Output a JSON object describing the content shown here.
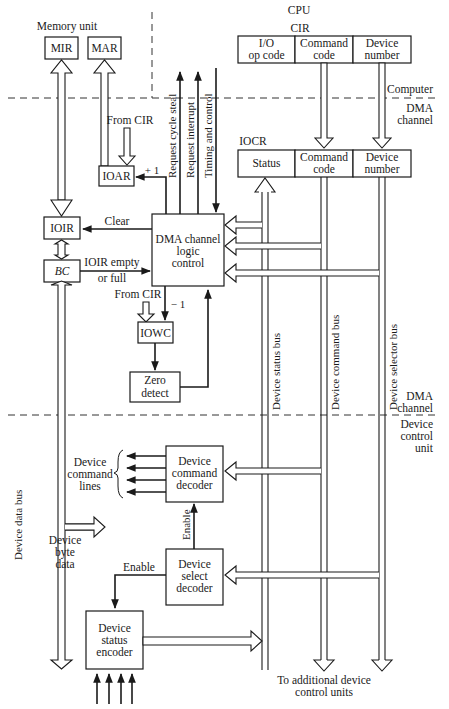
{
  "diagram": {
    "regions": {
      "cpu": "CPU",
      "memory_unit": "Memory unit",
      "computer": "Computer",
      "dma_channel_top": "DMA",
      "dma_channel_bottom": "channel",
      "dma_channel2_top": "DMA",
      "dma_channel2_bottom": "channel",
      "device_control_1": "Device",
      "device_control_2": "control",
      "device_control_3": "unit"
    },
    "registers": {
      "mir": "MIR",
      "mar": "MAR",
      "cir_title": "CIR",
      "cir_fields": [
        {
          "line1": "I/O",
          "line2": "op code"
        },
        {
          "line1": "Command",
          "line2": "code"
        },
        {
          "line1": "Device",
          "line2": "number"
        }
      ],
      "iocr_title": "IOCR",
      "iocr_fields": [
        {
          "line1": "Status"
        },
        {
          "line1": "Command",
          "line2": "code"
        },
        {
          "line1": "Device",
          "line2": "number"
        }
      ],
      "ioar": "IOAR",
      "ioir": "IOIR",
      "bc": "BC",
      "iowc": "IOWC"
    },
    "blocks": {
      "dma_logic": {
        "line1": "DMA channel",
        "line2": "logic",
        "line3": "control"
      },
      "zero_detect": {
        "line1": "Zero",
        "line2": "detect"
      },
      "cmd_decoder": {
        "line1": "Device",
        "line2": "command",
        "line3": "decoder"
      },
      "sel_decoder": {
        "line1": "Device",
        "line2": "select",
        "line3": "decoder"
      },
      "status_encoder": {
        "line1": "Device",
        "line2": "status",
        "line3": "encoder"
      }
    },
    "signals": {
      "request_cycle_steal": "Request cycle steal",
      "request_interrupt": "Request interrupt",
      "timing_control": "Timing and control",
      "from_cir_1": "From CIR",
      "from_cir_2": "From CIR",
      "plus_one": "+ 1",
      "minus_one": "− 1",
      "clear": "Clear",
      "ioir_empty": "IOIR empty",
      "or_full": "or full",
      "enable_1": "Enable",
      "enable_2": "Enable"
    },
    "buses": {
      "device_status_bus": "Device status bus",
      "device_command_bus": "Device command bus",
      "device_selector_bus": "Device selector bus",
      "device_data_bus": "Device data bus"
    },
    "device_lines": {
      "l1": "Device",
      "l2": "command",
      "l3": "lines",
      "byte1": "Device",
      "byte2": "byte",
      "byte3": "data"
    },
    "footer": {
      "line1": "To additional device",
      "line2": "control units"
    }
  }
}
